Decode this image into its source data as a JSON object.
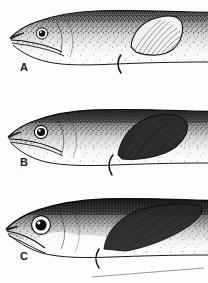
{
  "plate": {
    "type": "scientific-illustration",
    "medium": "stippled pen-and-ink line drawing",
    "subject": "lateral view of anterior body and head of three fishes",
    "background_color": "#fefefe",
    "ink_color": "#1b1b1b",
    "width_px": 208,
    "height_px": 283,
    "panel_count": 3
  },
  "panels": [
    {
      "id": "a",
      "label": "A",
      "label_position": {
        "x": 20,
        "y": 62
      },
      "bounds": {
        "x": 0,
        "y": 0,
        "width": 208,
        "height": 92
      },
      "description": "Head and anterior trunk of an elongate fish facing left; snout pointed, lower jaw slightly projecting, mouth long and terminal. Body densely stippled dark along the dorsum, fading to pale on the belly. Dorsal fin set well back, broad and rounded with fine parallel rays. Thin curved pelvic filament below.",
      "features": {
        "eye_size": "small",
        "eye_relative": "small round eye with dark pupil and pale iris ring",
        "snout": "pointed, elongate",
        "jaw": "lower jaw projecting slightly beyond upper",
        "dorsal_fin": "large rounded, pale with fine parallel rays (striated)",
        "dorsal_fin_position": "set far back, beginning about two-thirds along the shown body",
        "pelvic_filament": "present, short thin curve below pectoral region",
        "stipple_density": "moderate; dark dorsal band fading ventrally",
        "body_depth": "slender"
      }
    },
    {
      "id": "b",
      "label": "B",
      "label_position": {
        "x": 20,
        "y": 64
      },
      "bounds": {
        "x": 0,
        "y": 93,
        "width": 208,
        "height": 95
      },
      "description": "Head and anterior trunk facing left; snout blunter and shorter than A. Eye moderately large with strong dark pupil. Dorsal body heavily stippled to near black along the upper margin. Dorsal fin dark, triangular and more pointed, arising closer to the head. Thin pelvic filament below.",
      "features": {
        "eye_size": "medium",
        "eye_relative": "moderately large round eye, dark pupil with pale highlight",
        "snout": "blunt, short",
        "jaw": "terminal mouth, slight underbite",
        "dorsal_fin": "dark, triangular, pointed apex",
        "dorsal_fin_position": "arises nearer mid-body than in A",
        "pelvic_filament": "present, long thin curve",
        "stipple_density": "dense dark dorsum with sharp pale ventral contrast",
        "body_depth": "slender, slightly deeper than A"
      }
    },
    {
      "id": "c",
      "label": "C",
      "label_position": {
        "x": 20,
        "y": 62
      },
      "bounds": {
        "x": 0,
        "y": 189,
        "width": 208,
        "height": 94
      },
      "description": "Head and anterior trunk facing left; head short and deep with a very large eye. Mouth small and oblique with a thin open gape. Dorsal surface very dark. Dorsal fin low and long, dark, running back along the body. Pale ventral patch beneath pectoral region with short pelvic filament.",
      "features": {
        "eye_size": "large",
        "eye_relative": "very large round eye, bold black pupil with white iris ring",
        "snout": "short, blunt, deep head",
        "jaw": "small oblique mouth, thin gape line",
        "dorsal_fin": "dark, low and elongate along the back",
        "dorsal_fin_position": "long-based, running well back",
        "pelvic_filament": "present, short, against pale belly patch",
        "stipple_density": "very dense; strong dark dorsal mass, bright pale belly",
        "body_depth": "deepest of the three"
      }
    }
  ]
}
